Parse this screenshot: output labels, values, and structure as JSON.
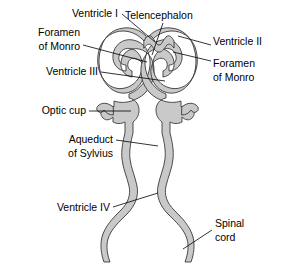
{
  "figure": {
    "background_color": "#ffffff",
    "wall_fill_color": "#c9c9c9",
    "wall_stroke_color": "#3a3a3a",
    "leader_color": "#000000",
    "text_color": "#000000"
  },
  "labels": [
    {
      "id": "ventricle-1",
      "text": "Ventricle I",
      "lines": [
        "Ventricle I"
      ],
      "side": "left",
      "x": 118,
      "y": 14,
      "anchor": "end",
      "leader": "M122,14 L155,42"
    },
    {
      "id": "telencephalon",
      "text": "Telencephalon",
      "lines": [
        "Telencephalon"
      ],
      "side": "top",
      "x": 125,
      "y": 16,
      "anchor": "start",
      "leader": "M163,23 L152,55"
    },
    {
      "id": "foramen-of-monro-left",
      "text": "Foramen of Monro",
      "lines": [
        "Foramen",
        "of Monro"
      ],
      "side": "left",
      "x": 80,
      "y": 38,
      "anchor": "end",
      "leader": "M83,45 L147,62"
    },
    {
      "id": "ventricle-2",
      "text": "Ventricle II",
      "lines": [
        "Ventricle II"
      ],
      "side": "right",
      "x": 213,
      "y": 42,
      "anchor": "start",
      "leader": "M211,45 L178,36"
    },
    {
      "id": "ventricle-3",
      "text": "Ventricle III",
      "lines": [
        "Ventricle III"
      ],
      "side": "left",
      "x": 98,
      "y": 72,
      "anchor": "end",
      "leader": "M101,72 L165,81"
    },
    {
      "id": "foramen-of-monro-right",
      "text": "Foramen of Monro",
      "lines": [
        "Foramen",
        "of Monro"
      ],
      "side": "right",
      "x": 213,
      "y": 64,
      "anchor": "start",
      "leader": "M211,61 L173,52"
    },
    {
      "id": "optic-cup",
      "text": "Optic cup",
      "lines": [
        "Optic cup"
      ],
      "side": "left",
      "x": 86,
      "y": 111,
      "anchor": "end",
      "leader": "M89,111 L131,111"
    },
    {
      "id": "aqueduct-of-sylvius",
      "text": "Aqueduct of Sylvius",
      "lines": [
        "Aqueduct",
        "of Sylvius"
      ],
      "side": "left",
      "x": 113,
      "y": 146,
      "anchor": "end",
      "leader": "M116,140 L158,146"
    },
    {
      "id": "ventricle-4",
      "text": "Ventricle IV",
      "lines": [
        "Ventricle IV"
      ],
      "side": "left",
      "x": 110,
      "y": 208,
      "anchor": "end",
      "leader": "M113,207 L158,193"
    },
    {
      "id": "spinal-cord",
      "text": "Spinal cord",
      "lines": [
        "Spinal",
        "cord"
      ],
      "side": "right",
      "x": 215,
      "y": 227,
      "anchor": "start",
      "leader": "M212,230 L183,249"
    }
  ],
  "structures": [
    {
      "id": "lateral-ventricle-left",
      "name": "Left lateral ventricle loop"
    },
    {
      "id": "lateral-ventricle-right",
      "name": "Right lateral ventricle loop"
    },
    {
      "id": "telencephalon-roof",
      "name": "Telencephalon midline notch"
    },
    {
      "id": "optic-cup-left",
      "name": "Left optic cup"
    },
    {
      "id": "optic-cup-right",
      "name": "Right optic cup"
    },
    {
      "id": "aqueduct",
      "name": "Cerebral aqueduct channel"
    },
    {
      "id": "fourth-ventricle",
      "name": "Fourth ventricle expansion"
    },
    {
      "id": "spinal-canal",
      "name": "Spinal cord central canal"
    }
  ]
}
